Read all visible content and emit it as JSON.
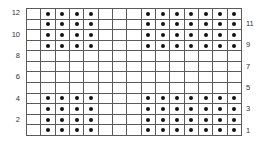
{
  "chart_data": {
    "type": "heatmap",
    "title": "",
    "columns": 15,
    "rows": 12,
    "row_labels": [
      {
        "row": 12,
        "label": "12",
        "side": "left"
      },
      {
        "row": 11,
        "label": "11",
        "side": "right"
      },
      {
        "row": 10,
        "label": "10",
        "side": "left"
      },
      {
        "row": 9,
        "label": "9",
        "side": "right"
      },
      {
        "row": 8,
        "label": "8",
        "side": "left"
      },
      {
        "row": 7,
        "label": "7",
        "side": "right"
      },
      {
        "row": 6,
        "label": "6",
        "side": "left"
      },
      {
        "row": 5,
        "label": "5",
        "side": "right"
      },
      {
        "row": 4,
        "label": "4",
        "side": "left"
      },
      {
        "row": 3,
        "label": "3",
        "side": "right"
      },
      {
        "row": 2,
        "label": "2",
        "side": "left"
      },
      {
        "row": 1,
        "label": "1",
        "side": "right"
      }
    ],
    "matrix_top_to_bottom": [
      [
        0,
        1,
        1,
        1,
        1,
        0,
        0,
        0,
        1,
        1,
        1,
        1,
        1,
        1,
        1
      ],
      [
        0,
        1,
        1,
        1,
        1,
        0,
        0,
        0,
        1,
        1,
        1,
        1,
        1,
        1,
        1
      ],
      [
        0,
        1,
        1,
        1,
        1,
        0,
        0,
        0,
        1,
        1,
        1,
        1,
        1,
        1,
        1
      ],
      [
        0,
        1,
        1,
        1,
        1,
        0,
        0,
        0,
        1,
        1,
        1,
        1,
        1,
        1,
        1
      ],
      [
        0,
        0,
        0,
        0,
        0,
        0,
        0,
        0,
        0,
        0,
        0,
        0,
        0,
        0,
        0
      ],
      [
        0,
        0,
        0,
        0,
        0,
        0,
        0,
        0,
        0,
        0,
        0,
        0,
        0,
        0,
        0
      ],
      [
        0,
        0,
        0,
        0,
        0,
        0,
        0,
        0,
        0,
        0,
        0,
        0,
        0,
        0,
        0
      ],
      [
        0,
        0,
        0,
        0,
        0,
        0,
        0,
        0,
        0,
        0,
        0,
        0,
        0,
        0,
        0
      ],
      [
        0,
        1,
        1,
        1,
        1,
        0,
        0,
        0,
        1,
        1,
        1,
        1,
        1,
        1,
        1
      ],
      [
        0,
        1,
        1,
        1,
        1,
        0,
        0,
        0,
        1,
        1,
        1,
        1,
        1,
        1,
        1
      ],
      [
        0,
        1,
        1,
        1,
        1,
        0,
        0,
        0,
        1,
        1,
        1,
        1,
        1,
        1,
        1
      ],
      [
        0,
        1,
        1,
        1,
        1,
        0,
        0,
        0,
        1,
        1,
        1,
        1,
        1,
        1,
        1
      ]
    ],
    "legend": {
      "1": "dot (stitch symbol)",
      "0": "empty"
    }
  },
  "colors": {
    "grid_line": "#5a5a5a",
    "dot": "#111111",
    "label": "#333333"
  }
}
